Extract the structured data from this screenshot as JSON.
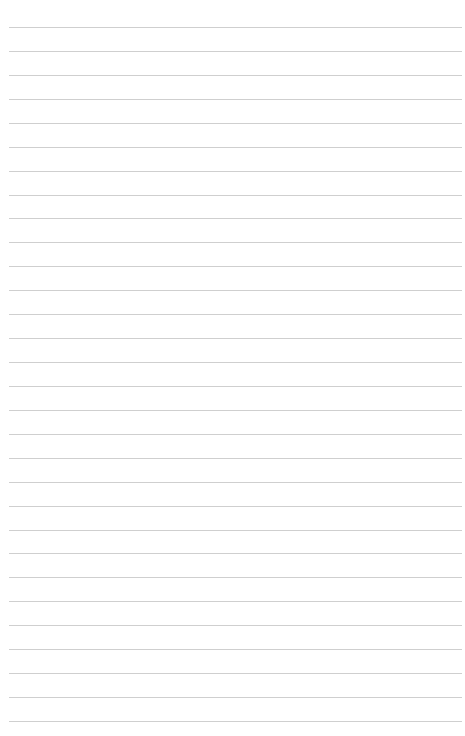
{
  "page": {
    "type": "lined-paper",
    "background_color": "#ffffff",
    "line_color": "#cfcfcf",
    "line_count": 30,
    "first_line_y": 27,
    "line_spacing": 23.93,
    "line_left": 9,
    "line_width": 453,
    "text": ""
  }
}
